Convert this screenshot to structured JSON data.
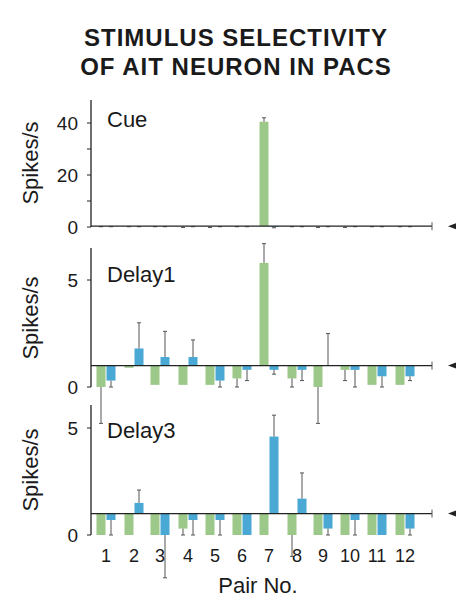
{
  "title_line1": "STIMULUS SELECTIVITY",
  "title_line2": "OF AIT NEURON IN PACS",
  "colors": {
    "green": "#9cc88a",
    "blue": "#4aa8d4",
    "axis": "#222222",
    "error": "#555555"
  },
  "chart_data": [
    {
      "type": "bar",
      "title": "Cue",
      "xlabel": "",
      "ylabel": "Spikes/s",
      "ylim": [
        0,
        48
      ],
      "yticks": [
        0,
        20,
        40
      ],
      "baseline": 0.3,
      "categories": [
        "1",
        "2",
        "3",
        "4",
        "5",
        "6",
        "7",
        "8",
        "9",
        "10",
        "11",
        "12"
      ],
      "series": [
        {
          "name": "green (first stimulus of pair)",
          "values": [
            0.2,
            0.2,
            0.2,
            0.2,
            0.2,
            0.2,
            40.5,
            0.2,
            0.2,
            0.2,
            0.2,
            0.2
          ],
          "errors": [
            0.1,
            0.1,
            0.1,
            0.4,
            0.4,
            0.1,
            1.5,
            0.1,
            0.4,
            0.4,
            0.1,
            0.1
          ]
        },
        {
          "name": "blue (paired associate)",
          "values": [
            0.2,
            0.2,
            0.2,
            0.2,
            0.2,
            0.2,
            0.0,
            0.2,
            0.2,
            0.2,
            0.2,
            0.2
          ],
          "errors": [
            0.1,
            0.1,
            0.1,
            0.1,
            0.1,
            0.1,
            0.3,
            0.1,
            0.1,
            0.1,
            0.1,
            0.1
          ]
        }
      ]
    },
    {
      "type": "bar",
      "title": "Delay1",
      "xlabel": "",
      "ylabel": "Spikes/s",
      "ylim": [
        0,
        6.3
      ],
      "yticks": [
        0,
        5
      ],
      "baseline": 1.0,
      "categories": [
        "1",
        "2",
        "3",
        "4",
        "5",
        "6",
        "7",
        "8",
        "9",
        "10",
        "11",
        "12"
      ],
      "series": [
        {
          "name": "green (first stimulus of pair)",
          "values": [
            0.0,
            0.9,
            0.1,
            0.1,
            0.1,
            0.4,
            5.8,
            0.4,
            0.0,
            0.8,
            0.1,
            0.1
          ],
          "errors": [
            1.7,
            0.0,
            0.0,
            0.0,
            0.0,
            0.4,
            0.9,
            0.4,
            1.7,
            0.5,
            0.0,
            0.0
          ]
        },
        {
          "name": "blue (paired associate)",
          "values": [
            0.3,
            1.8,
            1.4,
            1.4,
            0.3,
            0.8,
            0.8,
            0.8,
            1.0,
            0.8,
            0.5,
            0.5
          ],
          "errors": [
            0.3,
            1.2,
            1.2,
            0.8,
            0.3,
            0.5,
            0.2,
            0.5,
            1.5,
            0.8,
            0.5,
            0.2
          ]
        }
      ]
    },
    {
      "type": "bar",
      "title": "Delay3",
      "xlabel": "Pair No.",
      "ylabel": "Spikes/s",
      "ylim": [
        0,
        6.1
      ],
      "yticks": [
        0,
        5
      ],
      "baseline": 1.0,
      "categories": [
        "1",
        "2",
        "3",
        "4",
        "5",
        "6",
        "7",
        "8",
        "9",
        "10",
        "11",
        "12"
      ],
      "series": [
        {
          "name": "green (first stimulus of pair)",
          "values": [
            0.0,
            0.0,
            0.0,
            0.3,
            0.0,
            0.0,
            0.0,
            0.0,
            0.0,
            0.0,
            0.0,
            0.0
          ],
          "errors": [
            0.0,
            0.0,
            0.0,
            0.3,
            0.0,
            0.0,
            0.0,
            1.0,
            0.0,
            0.0,
            0.0,
            0.0
          ]
        },
        {
          "name": "blue (paired associate)",
          "values": [
            0.7,
            1.5,
            0.0,
            0.7,
            0.7,
            0.0,
            4.6,
            1.7,
            0.3,
            0.7,
            0.0,
            0.3
          ],
          "errors": [
            0.7,
            0.6,
            2.0,
            0.7,
            0.7,
            0.0,
            1.0,
            1.2,
            0.3,
            0.7,
            0.0,
            0.3
          ]
        }
      ]
    }
  ]
}
